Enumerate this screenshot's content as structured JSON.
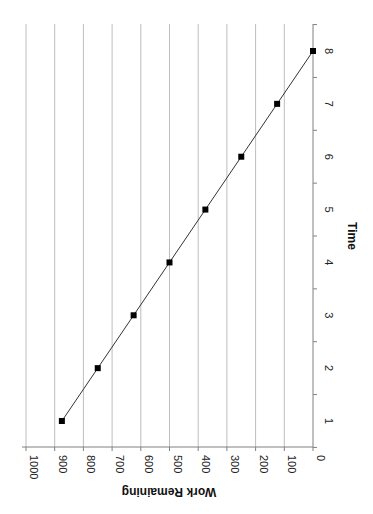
{
  "chart_data": {
    "type": "line",
    "title": "",
    "xlabel": "Time",
    "ylabel": "Work Remaining",
    "x": [
      1,
      2,
      3,
      4,
      5,
      6,
      7,
      8
    ],
    "series": [
      {
        "name": "Work Remaining",
        "values": [
          875,
          750,
          625,
          500,
          375,
          250,
          125,
          0
        ],
        "marker": "square",
        "color": "#000000"
      }
    ],
    "xticks": [
      "1",
      "2",
      "3",
      "4",
      "5",
      "6",
      "7",
      "8"
    ],
    "yticks": [
      "0",
      "100",
      "200",
      "300",
      "400",
      "500",
      "600",
      "700",
      "800",
      "900",
      "1000"
    ],
    "ylim": [
      0,
      1000
    ],
    "xlim": [
      0.5,
      8.5
    ],
    "grid": true,
    "legend": false,
    "orientation": "rotated-90-clockwise",
    "colors": {
      "grid": "#bdbdbd",
      "axis": "#808080",
      "line": "#333333",
      "marker": "#000000"
    }
  },
  "labels": {
    "x_title": "Time",
    "y_title": "Work Remaining"
  }
}
